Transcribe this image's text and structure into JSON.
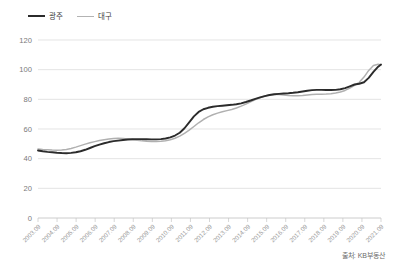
{
  "chart_data": {
    "type": "line",
    "title": "",
    "subtitle": "",
    "xlabel": "",
    "ylabel": "",
    "ylim": [
      0,
      120
    ],
    "yticks": [
      0,
      20,
      40,
      60,
      80,
      100,
      120
    ],
    "grid": true,
    "legend_position": "top-left",
    "source": "출처: KB부동산",
    "xtick_labels": [
      "2003.09",
      "2004.09",
      "2005.09",
      "2006.09",
      "2007.09",
      "2008.09",
      "2009.09",
      "2010.09",
      "2011.09",
      "2012.09",
      "2013.09",
      "2014.09",
      "2015.09",
      "2016.09",
      "2017.09",
      "2018.09",
      "2019.09",
      "2020.09",
      "2021.09"
    ],
    "x": [
      2003.75,
      2004.0,
      2004.25,
      2004.5,
      2004.75,
      2005.0,
      2005.25,
      2005.5,
      2005.75,
      2006.0,
      2006.25,
      2006.5,
      2006.75,
      2007.0,
      2007.25,
      2007.5,
      2007.75,
      2008.0,
      2008.25,
      2008.5,
      2008.75,
      2009.0,
      2009.25,
      2009.5,
      2009.75,
      2010.0,
      2010.25,
      2010.5,
      2010.75,
      2011.0,
      2011.25,
      2011.5,
      2011.75,
      2012.0,
      2012.25,
      2012.5,
      2012.75,
      2013.0,
      2013.25,
      2013.5,
      2013.75,
      2014.0,
      2014.25,
      2014.5,
      2014.75,
      2015.0,
      2015.25,
      2015.5,
      2015.75,
      2016.0,
      2016.25,
      2016.5,
      2016.75,
      2017.0,
      2017.25,
      2017.5,
      2017.75,
      2018.0,
      2018.25,
      2018.5,
      2018.75,
      2019.0,
      2019.25,
      2019.5,
      2019.75,
      2020.0,
      2020.25,
      2020.5,
      2020.75,
      2021.0,
      2021.25,
      2021.5,
      2021.75,
      2021.9
    ],
    "series": [
      {
        "name": "광주",
        "color": "#2b2b2b",
        "values": [
          45.5,
          45.0,
          44.6,
          44.3,
          44.0,
          43.8,
          43.7,
          43.9,
          44.3,
          45.0,
          46.0,
          47.2,
          48.4,
          49.5,
          50.4,
          51.2,
          51.8,
          52.2,
          52.6,
          52.9,
          53.1,
          53.2,
          53.2,
          53.1,
          53.0,
          53.0,
          53.2,
          53.6,
          54.4,
          55.6,
          57.5,
          60.5,
          64.5,
          68.5,
          71.5,
          73.3,
          74.3,
          75.0,
          75.4,
          75.7,
          76.0,
          76.3,
          76.7,
          77.3,
          78.2,
          79.2,
          80.3,
          81.3,
          82.2,
          82.9,
          83.4,
          83.7,
          83.9,
          84.1,
          84.4,
          84.8,
          85.3,
          85.8,
          86.2,
          86.4,
          86.4,
          86.3,
          86.3,
          86.4,
          86.8,
          87.6,
          88.8,
          90.0,
          90.5,
          91.5,
          94.5,
          98.5,
          102.0,
          103.5
        ]
      },
      {
        "name": "대구",
        "color": "#b0b0b0",
        "values": [
          46.5,
          46.2,
          46.0,
          45.8,
          45.7,
          45.8,
          46.2,
          46.9,
          47.8,
          48.8,
          49.8,
          50.7,
          51.5,
          52.2,
          52.8,
          53.3,
          53.6,
          53.7,
          53.6,
          53.3,
          52.9,
          52.4,
          52.0,
          51.7,
          51.5,
          51.5,
          51.7,
          52.1,
          52.8,
          53.8,
          55.2,
          57.0,
          59.2,
          61.7,
          64.2,
          66.4,
          68.2,
          69.6,
          70.7,
          71.6,
          72.4,
          73.2,
          74.2,
          75.4,
          76.8,
          78.3,
          79.8,
          81.1,
          82.2,
          83.0,
          83.3,
          83.2,
          82.9,
          82.6,
          82.4,
          82.4,
          82.6,
          82.9,
          83.2,
          83.4,
          83.5,
          83.6,
          83.8,
          84.2,
          84.9,
          86.0,
          87.6,
          89.5,
          91.5,
          95.0,
          99.5,
          102.8,
          103.6,
          103.2
        ]
      }
    ]
  },
  "legend": {
    "entries": [
      {
        "label": "광주",
        "swatch_name": "legend-swatch-gwangju"
      },
      {
        "label": "대구",
        "swatch_name": "legend-swatch-daegu"
      }
    ]
  },
  "source_note": "출처: KB부동산"
}
